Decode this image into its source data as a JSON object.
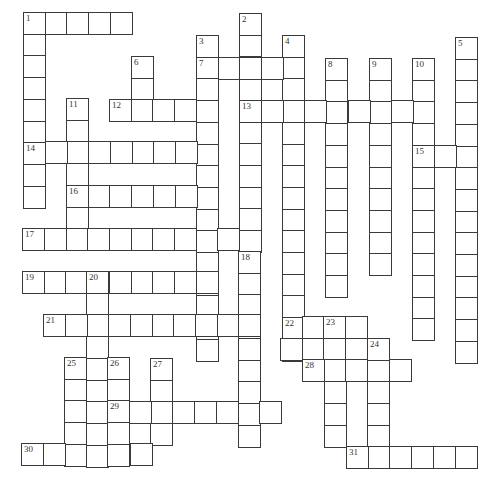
{
  "puzzle": {
    "type": "crossword",
    "cell_size": 21.7,
    "words": [
      {
        "num": "1",
        "dir": "across",
        "x": 23,
        "y": 12,
        "len": 5
      },
      {
        "num": "1",
        "dir": "down",
        "x": 23,
        "y": 12,
        "len": 9
      },
      {
        "num": "2",
        "dir": "down",
        "x": 239,
        "y": 13,
        "len": 11
      },
      {
        "num": "3",
        "dir": "down",
        "x": 196,
        "y": 35,
        "len": 15
      },
      {
        "num": "4",
        "dir": "down",
        "x": 282,
        "y": 35,
        "len": 15
      },
      {
        "num": "5",
        "dir": "down",
        "x": 455,
        "y": 37,
        "len": 15
      },
      {
        "num": "6",
        "dir": "down",
        "x": 131,
        "y": 56,
        "len": 3
      },
      {
        "num": "7",
        "dir": "across",
        "x": 196,
        "y": 57,
        "len": 5
      },
      {
        "num": "8",
        "dir": "down",
        "x": 325,
        "y": 58,
        "len": 11
      },
      {
        "num": "9",
        "dir": "down",
        "x": 369,
        "y": 58,
        "len": 10
      },
      {
        "num": "10",
        "dir": "down",
        "x": 412,
        "y": 58,
        "len": 13
      },
      {
        "num": "11",
        "dir": "down",
        "x": 66,
        "y": 98,
        "len": 7
      },
      {
        "num": "12",
        "dir": "across",
        "x": 109,
        "y": 99,
        "len": 5
      },
      {
        "num": "13",
        "dir": "across",
        "x": 239,
        "y": 100,
        "len": 9
      },
      {
        "num": "14",
        "dir": "across",
        "x": 23,
        "y": 141,
        "len": 9
      },
      {
        "num": "15",
        "dir": "across",
        "x": 412,
        "y": 145,
        "len": 3
      },
      {
        "num": "16",
        "dir": "across",
        "x": 66,
        "y": 185,
        "len": 7
      },
      {
        "num": "17",
        "dir": "across",
        "x": 22,
        "y": 228,
        "len": 11
      },
      {
        "num": "18",
        "dir": "down",
        "x": 238,
        "y": 251,
        "len": 9
      },
      {
        "num": "19",
        "dir": "across",
        "x": 22,
        "y": 271,
        "len": 9
      },
      {
        "num": "20",
        "dir": "down",
        "x": 86,
        "y": 271,
        "len": 9
      },
      {
        "num": "21",
        "dir": "across",
        "x": 43,
        "y": 314,
        "len": 10
      },
      {
        "num": "22",
        "dir": "across",
        "x": 280,
        "y": 316,
        "len": 4
      },
      {
        "num": "",
        "dir": "across",
        "x": 280,
        "y": 338,
        "len": 5
      },
      {
        "num": "23",
        "dir": "down",
        "x": 324,
        "y": 316,
        "len": 6
      },
      {
        "num": "24",
        "dir": "down",
        "x": 367,
        "y": 338,
        "len": 5
      },
      {
        "num": "25",
        "dir": "down",
        "x": 64,
        "y": 357,
        "len": 5
      },
      {
        "num": "26",
        "dir": "down",
        "x": 107,
        "y": 357,
        "len": 5
      },
      {
        "num": "27",
        "dir": "down",
        "x": 150,
        "y": 358,
        "len": 4
      },
      {
        "num": "28",
        "dir": "across",
        "x": 302,
        "y": 359,
        "len": 5
      },
      {
        "num": "29",
        "dir": "across",
        "x": 107,
        "y": 401,
        "len": 8
      },
      {
        "num": "30",
        "dir": "across",
        "x": 21,
        "y": 443,
        "len": 6
      },
      {
        "num": "31",
        "dir": "across",
        "x": 346,
        "y": 446,
        "len": 6
      }
    ]
  }
}
